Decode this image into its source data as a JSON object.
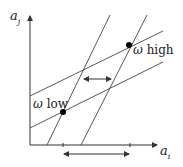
{
  "diagram": {
    "axes": {
      "y_label_main": "a",
      "y_label_sub": "j",
      "x_label_main": "a",
      "x_label_sub": "i"
    },
    "points": [
      {
        "id": "omega-high",
        "symbol": "ω",
        "text": "high",
        "x": 129,
        "y": 45
      },
      {
        "id": "omega-low",
        "symbol": "ω",
        "text": "low",
        "x": 63,
        "y": 112
      }
    ],
    "lines": {
      "steep": [
        {
          "x1": 47,
          "y1": 145,
          "x2": 110,
          "y2": 15
        },
        {
          "x1": 81,
          "y1": 145,
          "x2": 147,
          "y2": 15
        }
      ],
      "shallow": [
        {
          "x1": 30,
          "y1": 96,
          "x2": 163,
          "y2": 31
        },
        {
          "x1": 30,
          "y1": 128,
          "x2": 163,
          "y2": 62
        }
      ]
    },
    "arrows": [
      {
        "id": "middle-double-arrow",
        "x1": 83,
        "x2": 111,
        "y": 79
      },
      {
        "id": "bottom-double-arrow",
        "x1": 63,
        "x2": 129,
        "y": 154
      }
    ],
    "ticks": [
      63,
      130
    ],
    "colors": {
      "stroke": "#333333",
      "point": "#000000"
    }
  }
}
